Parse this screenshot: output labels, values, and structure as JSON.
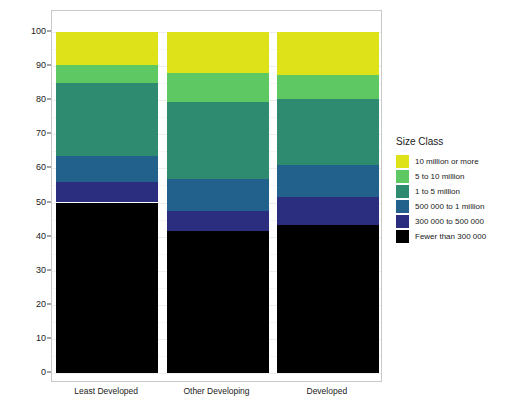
{
  "chart_data": {
    "type": "bar",
    "subtype": "stacked-bar-percentage",
    "title": "",
    "xlabel": "",
    "ylabel": "Percentage of Urban Population",
    "ylim": [
      0,
      100
    ],
    "yticks": [
      0,
      10,
      20,
      30,
      40,
      50,
      60,
      70,
      80,
      90,
      100
    ],
    "ytick_labels": [
      "0",
      "10",
      "20",
      "30",
      "40",
      "50",
      "60",
      "70",
      "80",
      "90",
      "100"
    ],
    "grid": true,
    "legend_position": "right",
    "legend_title": "Size Class",
    "categories": [
      "Least Developed",
      "Other Developing",
      "Developed"
    ],
    "series": [
      {
        "name": "Fewer than 300 000",
        "color": "#000000",
        "values": [
          50.0,
          41.5,
          43.5
        ]
      },
      {
        "name": "300 000 to 500 000",
        "color": "#2B2D7F",
        "values": [
          6.0,
          6.0,
          8.0
        ]
      },
      {
        "name": "500 000 to 1 million",
        "color": "#21618C",
        "values": [
          7.5,
          9.5,
          9.5
        ]
      },
      {
        "name": "1 to 5 million",
        "color": "#2E8B70",
        "values": [
          21.5,
          22.5,
          19.3
        ]
      },
      {
        "name": "5 to 10 million",
        "color": "#5EC962",
        "values": [
          5.3,
          8.5,
          7.2
        ]
      },
      {
        "name": "10 million or more",
        "color": "#DDE318",
        "values": [
          9.7,
          12.0,
          12.5
        ]
      }
    ],
    "cumulative_tops": {
      "Least Developed": [
        50.0,
        56.0,
        63.5,
        85.0,
        90.3,
        100.0
      ],
      "Other Developing": [
        41.5,
        47.5,
        57.0,
        79.5,
        88.0,
        100.0
      ],
      "Developed": [
        43.5,
        51.5,
        61.0,
        80.3,
        87.5,
        100.0
      ]
    }
  },
  "legend": {
    "title": "Size Class",
    "items": [
      {
        "label": "10 million or more",
        "color": "#DDE318"
      },
      {
        "label": "5 to 10 million",
        "color": "#5EC962"
      },
      {
        "label": "1 to 5 million",
        "color": "#2E8B70"
      },
      {
        "label": "500 000 to 1 million",
        "color": "#21618C"
      },
      {
        "label": "300 000 to 500 000",
        "color": "#2B2D7F"
      },
      {
        "label": "Fewer than 300 000",
        "color": "#000000"
      }
    ]
  },
  "axes": {
    "y_title": "Percentage of Urban Population"
  }
}
